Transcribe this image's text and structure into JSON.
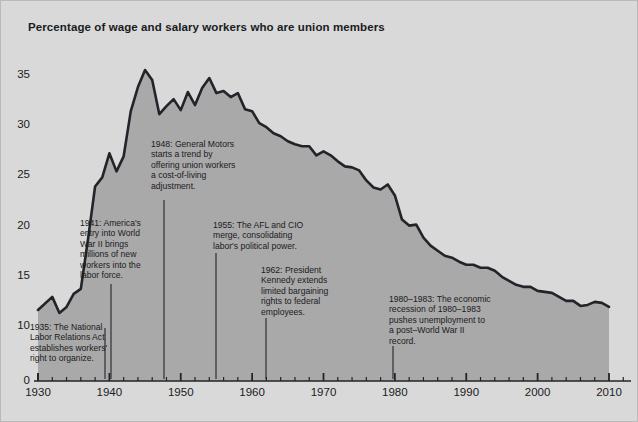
{
  "chart_data": {
    "type": "area",
    "title": "Percentage of wage and salary workers who are union members",
    "xlabel": "",
    "ylabel": "",
    "xlim": [
      1930,
      2012
    ],
    "ylim": [
      0,
      38
    ],
    "grid": false,
    "legend": "none",
    "y_ticks": [
      "0",
      "10",
      "15",
      "20",
      "25",
      "30",
      "35"
    ],
    "y_tick_values": [
      0,
      10,
      15,
      20,
      25,
      30,
      35
    ],
    "x_ticks": [
      "1930",
      "1940",
      "1950",
      "1960",
      "1970",
      "1980",
      "1990",
      "2000",
      "2010"
    ],
    "x_tick_values": [
      1930,
      1940,
      1950,
      1960,
      1970,
      1980,
      1990,
      2000,
      2010
    ],
    "x_minor_tick_interval": 2,
    "series_name": "Union membership rate",
    "x": [
      1930,
      1932,
      1933,
      1934,
      1935,
      1936,
      1937,
      1938,
      1939,
      1940,
      1941,
      1942,
      1943,
      1944,
      1945,
      1946,
      1947,
      1948,
      1949,
      1950,
      1951,
      1952,
      1953,
      1954,
      1955,
      1956,
      1957,
      1958,
      1959,
      1960,
      1961,
      1962,
      1963,
      1964,
      1965,
      1966,
      1967,
      1968,
      1969,
      1970,
      1971,
      1972,
      1973,
      1974,
      1975,
      1976,
      1977,
      1978,
      1979,
      1980,
      1981,
      1982,
      1983,
      1984,
      1985,
      1986,
      1987,
      1988,
      1989,
      1990,
      1991,
      1992,
      1993,
      1994,
      1995,
      1996,
      1997,
      1998,
      1999,
      2000,
      2001,
      2002,
      2003,
      2004,
      2005,
      2006,
      2007,
      2008,
      2009,
      2010
    ],
    "values": [
      11.6,
      12.9,
      11.3,
      11.9,
      13.2,
      13.7,
      18.6,
      23.9,
      24.8,
      27.2,
      25.4,
      26.9,
      31.4,
      33.8,
      35.5,
      34.5,
      31.1,
      31.9,
      32.6,
      31.5,
      33.3,
      32.0,
      33.7,
      34.7,
      33.2,
      33.4,
      32.8,
      33.2,
      31.6,
      31.4,
      30.2,
      29.8,
      29.2,
      28.9,
      28.4,
      28.1,
      27.9,
      27.9,
      27.0,
      27.4,
      27.0,
      26.4,
      25.9,
      25.8,
      25.5,
      24.5,
      23.8,
      23.6,
      24.1,
      23.0,
      20.6,
      20.0,
      20.1,
      18.8,
      18.0,
      17.5,
      17.0,
      16.8,
      16.4,
      16.1,
      16.1,
      15.8,
      15.8,
      15.5,
      14.9,
      14.5,
      14.1,
      13.9,
      13.9,
      13.5,
      13.4,
      13.3,
      12.9,
      12.5,
      12.5,
      12.0,
      12.1,
      12.4,
      12.3,
      11.9
    ],
    "colors": {
      "background": "#d9d9d9",
      "plot_fill": "#a9a9a9",
      "line": "#23232a",
      "axis": "#23232a",
      "text": "#1b1b22"
    },
    "annotations": [
      {
        "id": "annotation-1935",
        "year": 1935,
        "text": "1935: The National\nLabor Relations Act\nestablishes workers'\nright to organize.",
        "leader_from_year": 1935
      },
      {
        "id": "annotation-1941",
        "year": 1941,
        "text": "1941: America's\nentry into World\nWar II brings\nmillions of new\nworkers into the\nlabor force.",
        "leader_from_year": 1941
      },
      {
        "id": "annotation-1948",
        "year": 1948,
        "text": "1948: General Motors\nstarts a trend by\noffering union workers\na cost-of-living\nadjustment.",
        "leader_from_year": 1948
      },
      {
        "id": "annotation-1955",
        "year": 1955,
        "text": "1955: The AFL and CIO\nmerge, consolidating\nlabor's political power.",
        "leader_from_year": 1955
      },
      {
        "id": "annotation-1962",
        "year": 1962,
        "text": "1962: President\nKennedy extends\nlimited bargaining\nrights to federal\nemployees.",
        "leader_from_year": 1962
      },
      {
        "id": "annotation-1980",
        "year": 1980,
        "text": "1980–1983: The economic\nrecession of 1980–1983\npushes unemployment to\na post–World War II\nrecord.",
        "leader_from_year": 1980
      }
    ]
  },
  "annotation_layout": [
    {
      "left": 29,
      "top": 321,
      "leader_x": 104,
      "leader_y0": 327,
      "leader_y1": 378
    },
    {
      "left": 79,
      "top": 217,
      "leader_x": 110,
      "leader_y0": 283,
      "leader_y1": 378
    },
    {
      "left": 150,
      "top": 138,
      "leader_x": 163,
      "leader_y0": 199,
      "leader_y1": 378
    },
    {
      "left": 212,
      "top": 219,
      "leader_x": 215,
      "leader_y0": 252,
      "leader_y1": 378
    },
    {
      "left": 260,
      "top": 264,
      "leader_x": 265,
      "leader_y0": 317,
      "leader_y1": 378
    },
    {
      "left": 388,
      "top": 293,
      "leader_x": 392,
      "leader_y0": 345,
      "leader_y1": 378
    }
  ]
}
